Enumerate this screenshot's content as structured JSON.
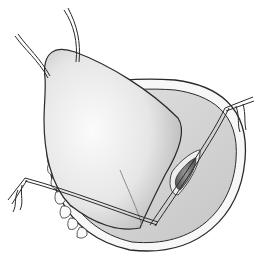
{
  "image": {
    "width": 263,
    "height": 263,
    "subject": "surgical illustration: retracted flap with stay sutures over oval oral cavity opening, incised gland duct",
    "palette": {
      "background": "#ffffff",
      "outline": "#2a2a2a",
      "flap_light": "#f2f2f2",
      "flap_shadow": "#bdbdbd",
      "cavity": "#d4d4d4",
      "incision": "#6e6e6e"
    }
  }
}
